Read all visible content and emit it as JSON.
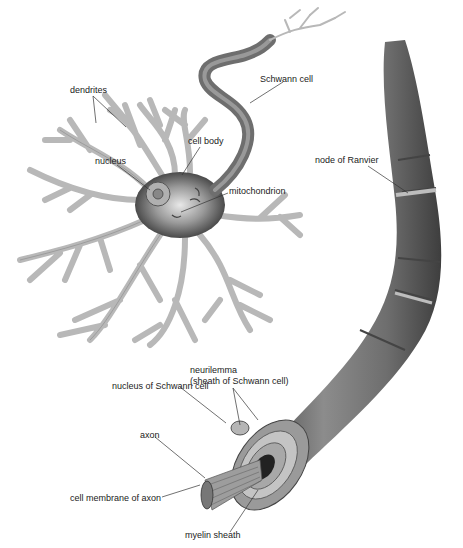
{
  "diagram": {
    "colors": {
      "background": "#ffffff",
      "dendrite_fill": "#c8c8c8",
      "dendrite_stroke": "#8a8a8a",
      "sheath_dark": "#5a5a5a",
      "sheath_mid": "#7a7a7a",
      "sheath_light": "#a0a0a0",
      "label_text": "#222222",
      "leader_line": "#333333"
    },
    "labels": {
      "dendrites": "dendrites",
      "cell_body": "cell body",
      "nucleus": "nucleus",
      "mitochondrion": "mitochondrion",
      "schwann_cell": "Schwann cell",
      "node_of_ranvier": "node of Ranvier",
      "neurilemma_line1": "neurilemma",
      "neurilemma_line2": "(sheath of Schwann cell)",
      "nucleus_of_schwann_cell": "nucleus of Schwann cell",
      "axon": "axon",
      "cell_membrane_of_axon": "cell membrane of axon",
      "myelin_sheath": "myelin sheath"
    }
  }
}
